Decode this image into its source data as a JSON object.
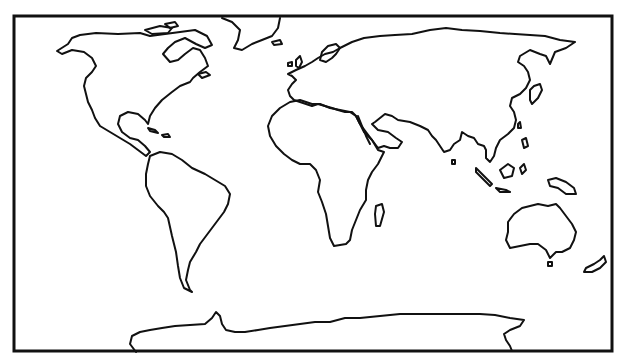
{
  "map": {
    "type": "blank world outline map",
    "projection": "equirectangular-like",
    "colors": {
      "background": "#ffffff",
      "outline": "#111111"
    },
    "frame": {
      "x": 14,
      "y": 16,
      "width": 598,
      "height": 335
    },
    "features": [
      {
        "id": "north-america",
        "name": "North America"
      },
      {
        "id": "greenland",
        "name": "Greenland"
      },
      {
        "id": "south-america",
        "name": "South America"
      },
      {
        "id": "eurasia",
        "name": "Europe and Asia"
      },
      {
        "id": "africa",
        "name": "Africa"
      },
      {
        "id": "madagascar",
        "name": "Madagascar"
      },
      {
        "id": "australia",
        "name": "Australia"
      },
      {
        "id": "new-zealand",
        "name": "New Zealand"
      },
      {
        "id": "antarctica",
        "name": "Antarctica"
      },
      {
        "id": "japan",
        "name": "Japan"
      },
      {
        "id": "uk",
        "name": "British Isles"
      },
      {
        "id": "indonesia",
        "name": "Indonesia / New Guinea"
      }
    ]
  }
}
